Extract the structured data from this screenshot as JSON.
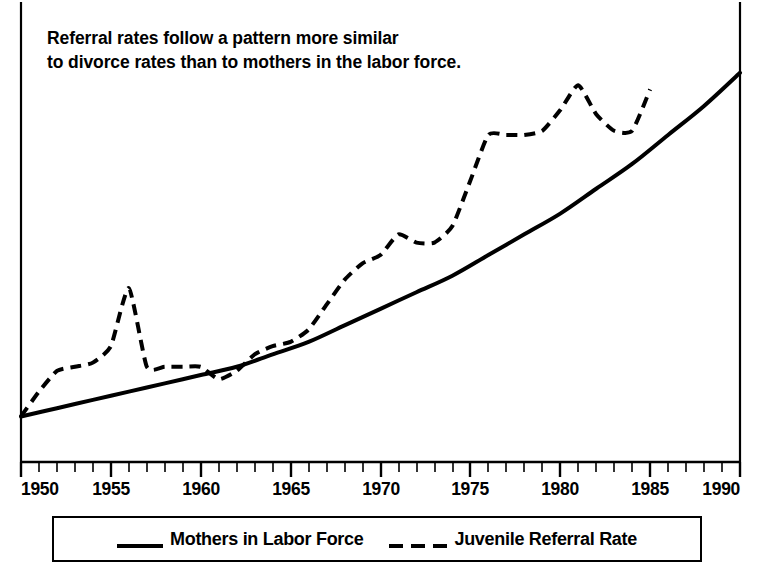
{
  "chart_data": {
    "type": "line",
    "title": "Referral rates follow a pattern more similar\nto divorce rates than to mothers in the labor force.",
    "xlabel": "",
    "ylabel": "",
    "xlim": [
      1950,
      1990
    ],
    "ylim": [
      0,
      100
    ],
    "grid": false,
    "legend_position": "bottom",
    "xticks": [
      1950,
      1955,
      1960,
      1965,
      1970,
      1975,
      1980,
      1985,
      1990
    ],
    "xtick_labels": [
      "1950",
      "1955",
      "1960",
      "1965",
      "1970",
      "1975",
      "1980",
      "1985",
      "1990"
    ],
    "minor_xtick_interval": 1,
    "yticks": [],
    "ytick_labels": [],
    "series": [
      {
        "name": "Mothers in Labor Force",
        "style": "solid",
        "color": "#000000",
        "x": [
          1950,
          1952,
          1954,
          1956,
          1958,
          1960,
          1962,
          1964,
          1966,
          1968,
          1970,
          1972,
          1974,
          1976,
          1978,
          1980,
          1982,
          1984,
          1986,
          1988,
          1990
        ],
        "values": [
          11,
          13,
          15,
          17,
          19,
          21,
          23,
          26,
          29,
          33,
          37,
          41,
          45,
          50,
          55,
          60,
          66,
          72,
          79,
          86,
          94
        ]
      },
      {
        "name": "Juvenile Referral Rate",
        "style": "dashed",
        "color": "#000000",
        "x": [
          1950,
          1951,
          1952,
          1953,
          1954,
          1955,
          1956,
          1957,
          1958,
          1959,
          1960,
          1961,
          1962,
          1963,
          1964,
          1965,
          1966,
          1967,
          1968,
          1969,
          1970,
          1971,
          1972,
          1973,
          1974,
          1975,
          1976,
          1977,
          1978,
          1979,
          1980,
          1981,
          1982,
          1983,
          1984,
          1985
        ],
        "values": [
          11,
          17,
          22,
          23,
          24,
          28,
          42,
          23,
          23,
          23,
          23,
          20,
          22,
          26,
          28,
          29,
          32,
          38,
          44,
          48,
          50,
          55,
          53,
          53,
          57,
          68,
          79,
          79,
          79,
          80,
          85,
          91,
          84,
          80,
          80,
          90
        ]
      }
    ]
  },
  "legend": {
    "entries": [
      {
        "label": "Mothers in Labor Force",
        "style": "solid"
      },
      {
        "label": "Juvenile Referral Rate",
        "style": "dashed"
      }
    ]
  },
  "axis": {
    "tick_labels": [
      "1950",
      "1955",
      "1960",
      "1965",
      "1970",
      "1975",
      "1980",
      "1985",
      "1990"
    ]
  }
}
